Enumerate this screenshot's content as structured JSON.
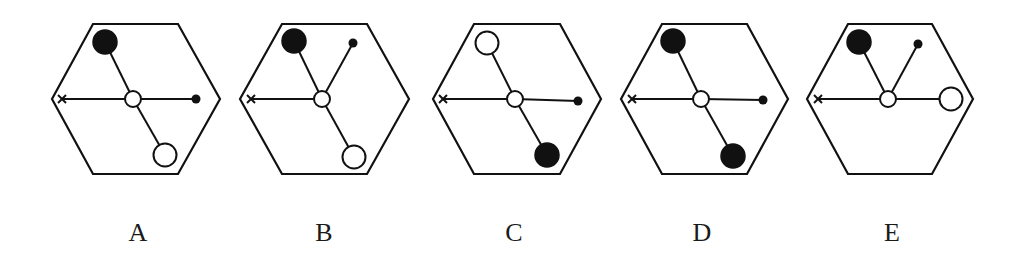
{
  "colors": {
    "stroke": "#111111",
    "fill_black": "#111111",
    "fill_white": "#ffffff",
    "label": "#1a1a1a"
  },
  "panels": [
    {
      "label": "A",
      "hexagon": [
        [
          93,
          24
        ],
        [
          178,
          24
        ],
        [
          220,
          99
        ],
        [
          178,
          174
        ],
        [
          93,
          174
        ],
        [
          52,
          99
        ]
      ],
      "center": [
        133,
        99
      ],
      "spokes": [
        {
          "to": [
            105,
            42
          ],
          "end": "big-black"
        },
        {
          "to": [
            62,
            99
          ],
          "end": "cross"
        },
        {
          "to": [
            196,
            99
          ],
          "end": "small-dot"
        },
        {
          "to": [
            165,
            155
          ],
          "end": "big-white"
        }
      ],
      "label_x": 138
    },
    {
      "label": "B",
      "hexagon": [
        [
          282,
          24
        ],
        [
          367,
          24
        ],
        [
          409,
          99
        ],
        [
          367,
          174
        ],
        [
          282,
          174
        ],
        [
          240,
          99
        ]
      ],
      "center": [
        322,
        99
      ],
      "spokes": [
        {
          "to": [
            294,
            41
          ],
          "end": "big-black"
        },
        {
          "to": [
            353,
            43
          ],
          "end": "small-dot"
        },
        {
          "to": [
            251,
            99
          ],
          "end": "cross"
        },
        {
          "to": [
            354,
            157
          ],
          "end": "big-white"
        }
      ],
      "label_x": 324
    },
    {
      "label": "C",
      "hexagon": [
        [
          474,
          24
        ],
        [
          560,
          24
        ],
        [
          601,
          99
        ],
        [
          560,
          174
        ],
        [
          474,
          174
        ],
        [
          433,
          99
        ]
      ],
      "center": [
        515,
        99
      ],
      "spokes": [
        {
          "to": [
            487,
            43
          ],
          "end": "big-white"
        },
        {
          "to": [
            443,
            99
          ],
          "end": "cross"
        },
        {
          "to": [
            578,
            101
          ],
          "end": "small-dot"
        },
        {
          "to": [
            547,
            155
          ],
          "end": "big-black"
        }
      ],
      "label_x": 514
    },
    {
      "label": "D",
      "hexagon": [
        [
          662,
          24
        ],
        [
          747,
          24
        ],
        [
          788,
          99
        ],
        [
          747,
          174
        ],
        [
          662,
          174
        ],
        [
          621,
          99
        ]
      ],
      "center": [
        701,
        99
      ],
      "spokes": [
        {
          "to": [
            673,
            41
          ],
          "end": "big-black"
        },
        {
          "to": [
            632,
            99
          ],
          "end": "cross"
        },
        {
          "to": [
            763,
            100
          ],
          "end": "small-dot"
        },
        {
          "to": [
            733,
            156
          ],
          "end": "big-black"
        }
      ],
      "label_x": 702
    },
    {
      "label": "E",
      "hexagon": [
        [
          848,
          24
        ],
        [
          932,
          24
        ],
        [
          973,
          99
        ],
        [
          932,
          174
        ],
        [
          848,
          174
        ],
        [
          807,
          99
        ]
      ],
      "center": [
        888,
        99
      ],
      "spokes": [
        {
          "to": [
            859,
            42
          ],
          "end": "big-black"
        },
        {
          "to": [
            918,
            44
          ],
          "end": "small-dot"
        },
        {
          "to": [
            818,
            99
          ],
          "end": "cross"
        },
        {
          "to": [
            951,
            99
          ],
          "end": "big-white"
        }
      ],
      "label_x": 892
    }
  ]
}
